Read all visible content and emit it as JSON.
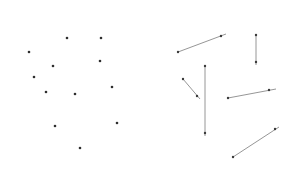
{
  "panels": [
    {
      "name": "points-panel",
      "description": "scattered points",
      "points": [
        [
          67,
          38
        ],
        [
          101,
          38
        ],
        [
          29,
          52
        ],
        [
          100,
          61
        ],
        [
          53,
          66
        ],
        [
          34,
          77
        ],
        [
          112,
          87
        ],
        [
          46,
          92
        ],
        [
          75,
          94
        ],
        [
          55,
          126
        ],
        [
          117,
          123
        ],
        [
          80,
          148
        ]
      ]
    },
    {
      "name": "vectors-panel",
      "description": "line segments with endpoint markers",
      "segments": [
        {
          "from": [
            178,
            52
          ],
          "to": [
            221,
            36
          ],
          "tail": [
            226,
            34
          ]
        },
        {
          "from": [
            256,
            35
          ],
          "to": [
            256,
            62
          ],
          "tail": [
            256,
            65
          ]
        },
        {
          "from": [
            205,
            66
          ],
          "to": [
            205,
            133
          ],
          "tail": [
            205,
            136
          ]
        },
        {
          "from": [
            183,
            79
          ],
          "to": [
            197,
            96
          ],
          "tail": [
            200,
            99
          ]
        },
        {
          "from": [
            228,
            98
          ],
          "to": [
            269,
            90
          ],
          "tail": [
            276,
            89
          ]
        },
        {
          "from": [
            233,
            157
          ],
          "to": [
            275,
            129
          ],
          "tail": [
            279,
            127
          ]
        }
      ]
    }
  ],
  "colors": {
    "background": "#ffffff",
    "point": "#2e2e2e",
    "segment": "#8a8a8a"
  }
}
